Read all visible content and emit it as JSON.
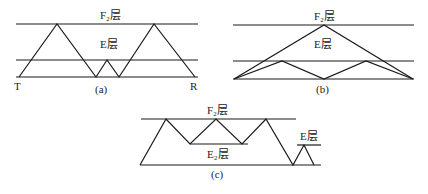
{
  "panels": {
    "a": {
      "caption": "(a)",
      "upper_layer_label": "F₂层",
      "lower_layer_label": "E层",
      "transmitter_label": "T",
      "receiver_label": "R"
    },
    "b": {
      "caption": "(b)",
      "upper_layer_label": "F₂层",
      "lower_layer_label": "E层"
    },
    "c": {
      "caption": "(c)",
      "upper_layer_label": "F₂层",
      "middle_layer_label": "E₂层",
      "small_layer_label": "E层"
    }
  }
}
